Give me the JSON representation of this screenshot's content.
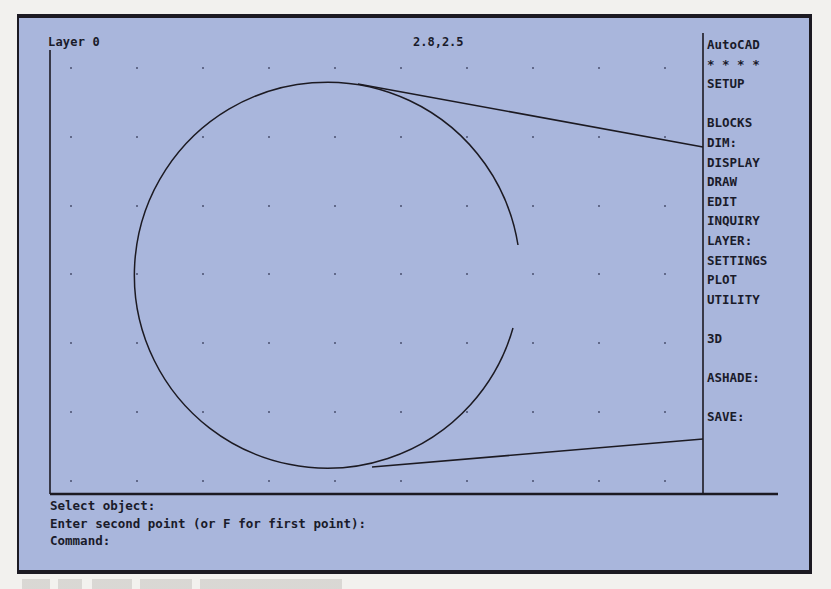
{
  "window": {
    "app_name": "AutoCAD"
  },
  "status_bar": {
    "layer": "Layer 0",
    "coordinates": "2.8,2.5"
  },
  "screen_menu": {
    "items": [
      {
        "label": "AutoCAD"
      },
      {
        "label": "* * * *"
      },
      {
        "label": "SETUP"
      },
      {
        "label": ""
      },
      {
        "label": "BLOCKS"
      },
      {
        "label": "DIM:"
      },
      {
        "label": "DISPLAY"
      },
      {
        "label": "DRAW"
      },
      {
        "label": "EDIT"
      },
      {
        "label": "INQUIRY"
      },
      {
        "label": "LAYER:"
      },
      {
        "label": "SETTINGS"
      },
      {
        "label": "PLOT"
      },
      {
        "label": "UTILITY"
      },
      {
        "label": ""
      },
      {
        "label": "3D"
      },
      {
        "label": ""
      },
      {
        "label": "ASHADE:"
      },
      {
        "label": ""
      },
      {
        "label": "SAVE:"
      }
    ]
  },
  "command_area": {
    "lines": [
      "Select object:",
      "Enter second point (or F for first point):",
      "Command:"
    ]
  },
  "drawing": {
    "grid": {
      "x": [
        71,
        137,
        203,
        269,
        335,
        401,
        467,
        533,
        599,
        665
      ],
      "y": [
        68,
        137,
        206,
        274,
        343,
        412,
        481
      ]
    },
    "arc": {
      "cx": 335,
      "cy": 276,
      "r": 193,
      "gap_start": [
        518,
        245
      ],
      "gap_end": [
        513,
        328
      ]
    },
    "tangent_lines": [
      {
        "x1": 358,
        "y1": 84,
        "x2": 703,
        "y2": 147
      },
      {
        "x1": 372,
        "y1": 467,
        "x2": 703,
        "y2": 439
      }
    ]
  },
  "colors": {
    "screen_bg": "#a9b6dc",
    "ink": "#1a1b2a",
    "frame": "#1c1a22"
  }
}
